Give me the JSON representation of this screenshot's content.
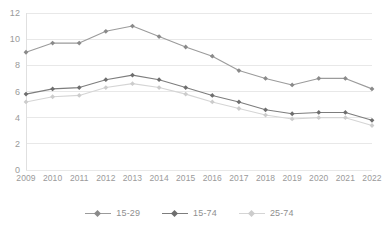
{
  "chart_data": {
    "type": "line",
    "title": "",
    "subtitle": "",
    "xlabel": "",
    "ylabel": "",
    "categories": [
      "2009",
      "2010",
      "2011",
      "2012",
      "2013",
      "2014",
      "2015",
      "2016",
      "2017",
      "2018",
      "2019",
      "2020",
      "2021",
      "2022"
    ],
    "x": [
      2009,
      2010,
      2011,
      2012,
      2013,
      2014,
      2015,
      2016,
      2017,
      2018,
      2019,
      2020,
      2021,
      2022
    ],
    "ylim": [
      0,
      12
    ],
    "xlim": [
      2009,
      2022
    ],
    "y_ticks": [
      0,
      2,
      4,
      6,
      8,
      10,
      12
    ],
    "y_tick_labels": [
      "0",
      "2",
      "4",
      "6",
      "8",
      "10",
      "12"
    ],
    "grid": true,
    "grid_axis": "y",
    "legend_position": "bottom",
    "markers": true,
    "marker_shape": "diamond",
    "series": [
      {
        "name": "15-29",
        "color": "#9b9b9b",
        "marker_color": "#8a8a8a",
        "values": [
          9.0,
          9.7,
          9.7,
          10.6,
          11.0,
          10.2,
          9.4,
          8.7,
          7.6,
          7.0,
          6.5,
          7.0,
          7.0,
          6.2
        ]
      },
      {
        "name": "15-74",
        "color": "#7d7d7d",
        "marker_color": "#6e6e6e",
        "values": [
          5.8,
          6.2,
          6.3,
          6.9,
          7.25,
          6.9,
          6.3,
          5.7,
          5.2,
          4.6,
          4.3,
          4.4,
          4.4,
          3.8
        ]
      },
      {
        "name": "25-74",
        "color": "#d5d5d5",
        "marker_color": "#cccccc",
        "values": [
          5.2,
          5.6,
          5.7,
          6.3,
          6.6,
          6.3,
          5.8,
          5.2,
          4.7,
          4.2,
          3.9,
          4.0,
          4.0,
          3.4
        ]
      }
    ]
  },
  "axes": {
    "grid_color": "#e8e8e8",
    "axis_line_color": "#e0e0e0",
    "tick_label_color": "#9a9a9a"
  },
  "legend": {
    "items": [
      {
        "label": "15-29"
      },
      {
        "label": "15-74"
      },
      {
        "label": "25-74"
      }
    ]
  }
}
